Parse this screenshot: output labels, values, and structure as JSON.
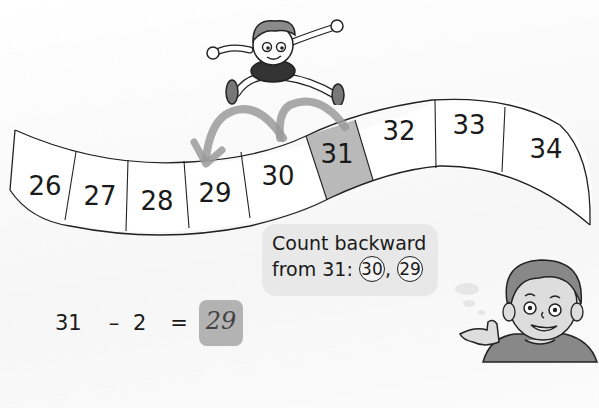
{
  "number_line": {
    "cells": [
      {
        "value": "26",
        "highlighted": false
      },
      {
        "value": "27",
        "highlighted": false
      },
      {
        "value": "28",
        "highlighted": false
      },
      {
        "value": "29",
        "highlighted": false
      },
      {
        "value": "30",
        "highlighted": false
      },
      {
        "value": "31",
        "highlighted": true
      },
      {
        "value": "32",
        "highlighted": false
      },
      {
        "value": "33",
        "highlighted": false
      },
      {
        "value": "34",
        "highlighted": false
      }
    ],
    "highlight_color": "#b9b9b9",
    "arrow_color": "#9a9a9a",
    "jumps": [
      {
        "from": "31",
        "to": "30"
      },
      {
        "from": "30",
        "to": "29"
      }
    ]
  },
  "speech_bubble": {
    "line1": "Count backward",
    "line2_prefix": "from 31:",
    "circled": [
      "30",
      "29"
    ],
    "separator": ","
  },
  "equation": {
    "a": "31",
    "operator": "–",
    "b": "2",
    "equals": "=",
    "answer": "29"
  },
  "illustrations": {
    "jumping_boy": "cartoon boy leaping over number line",
    "thinking_boy": "cartoon boy pointing thumb"
  }
}
